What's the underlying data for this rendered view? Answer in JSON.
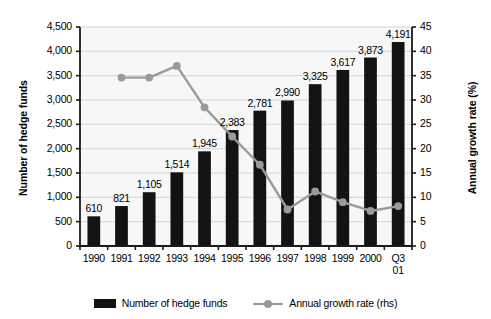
{
  "chart_data": {
    "type": "bar",
    "title": "",
    "subtitle": "",
    "xlabel": "",
    "ylabel": "Number of hedge funds",
    "y2label": "Annual growth rate (%)",
    "categories": [
      "1990",
      "1991",
      "1992",
      "1993",
      "1994",
      "1995",
      "1996",
      "1997",
      "1998",
      "1999",
      "2000",
      "Q3\n01"
    ],
    "grid": true,
    "legend_position": "bottom",
    "ylim": [
      0,
      4500
    ],
    "y2lim": [
      0,
      45
    ],
    "yticks": [
      "0",
      "500",
      "1,000",
      "1,500",
      "2,000",
      "2,500",
      "3,000",
      "3,500",
      "4,000",
      "4,500"
    ],
    "ytick_values": [
      0,
      500,
      1000,
      1500,
      2000,
      2500,
      3000,
      3500,
      4000,
      4500
    ],
    "y2ticks": [
      "0",
      "5",
      "10",
      "15",
      "20",
      "25",
      "30",
      "35",
      "40",
      "45"
    ],
    "y2tick_values": [
      0,
      5,
      10,
      15,
      20,
      25,
      30,
      35,
      40,
      45
    ],
    "series": [
      {
        "name": "Number of hedge funds",
        "kind": "bar",
        "axis": "left",
        "color": "#131313",
        "values": [
          610,
          821,
          1105,
          1514,
          1945,
          2383,
          2781,
          2990,
          3325,
          3617,
          3873,
          4191
        ],
        "labels": [
          "610",
          "821",
          "1,105",
          "1,514",
          "1,945",
          "2,383",
          "2,781",
          "2,990",
          "3,325",
          "3,617",
          "3,873",
          "4,191"
        ]
      },
      {
        "name": "Annual growth rate (rhs)",
        "kind": "line",
        "axis": "right",
        "color": "#9a9a9a",
        "values": [
          null,
          34.6,
          34.6,
          37.0,
          28.5,
          22.5,
          16.7,
          7.5,
          11.2,
          9.0,
          7.2,
          8.2
        ]
      }
    ]
  },
  "legend": {
    "items": [
      {
        "label": "Number of hedge funds",
        "marker": "bar-swatch"
      },
      {
        "label": "Annual growth rate (rhs)",
        "marker": "line-marker-swatch"
      }
    ]
  },
  "colors": {
    "bar": "#131313",
    "line": "#9a9a9a",
    "grid": "#d5d5d5",
    "axis": "#1a1a1a",
    "plot_background": "#f7f7f7",
    "page_background": "#ffffff"
  }
}
